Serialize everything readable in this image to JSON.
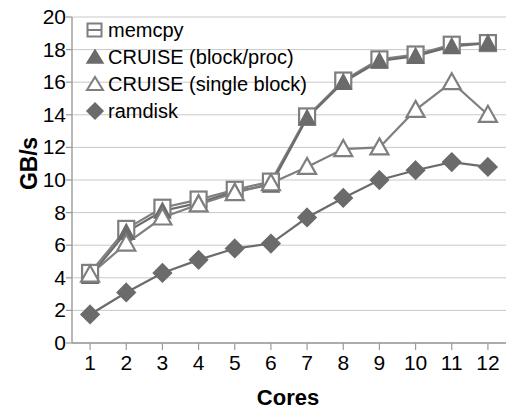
{
  "chart_data": {
    "type": "line",
    "title": "",
    "xlabel": "Cores",
    "ylabel": "GB/s",
    "x": [
      1,
      2,
      3,
      4,
      5,
      6,
      7,
      8,
      9,
      10,
      11,
      12
    ],
    "categories": [
      "1",
      "2",
      "3",
      "4",
      "5",
      "6",
      "7",
      "8",
      "9",
      "10",
      "11",
      "12"
    ],
    "xlim": [
      0.5,
      12.5
    ],
    "ylim": [
      0,
      20
    ],
    "ytick_labels": [
      "0",
      "2",
      "4",
      "6",
      "8",
      "10",
      "12",
      "14",
      "16",
      "18",
      "20"
    ],
    "ytick_values": [
      0,
      2,
      4,
      6,
      8,
      10,
      12,
      14,
      16,
      18,
      20
    ],
    "grid": true,
    "grid_axis": "y",
    "legend_position": "upper-left-inside",
    "series": [
      {
        "name": "memcpy",
        "marker": "open-square",
        "color": "#7f7f7f",
        "values": [
          4.3,
          7.0,
          8.3,
          8.8,
          9.4,
          9.9,
          13.9,
          16.1,
          17.4,
          17.7,
          18.3,
          18.4
        ]
      },
      {
        "name": "CRUISE (block/proc)",
        "marker": "filled-triangle",
        "color": "#6b6b6b",
        "values": [
          4.1,
          6.8,
          8.1,
          8.6,
          9.3,
          9.7,
          13.8,
          16.0,
          17.3,
          17.6,
          18.2,
          18.4
        ]
      },
      {
        "name": "CRUISE (single block)",
        "marker": "open-triangle",
        "color": "#7f7f7f",
        "values": [
          4.2,
          6.1,
          7.7,
          8.5,
          9.2,
          9.8,
          10.8,
          11.9,
          12.0,
          14.3,
          16.0,
          14.0
        ]
      },
      {
        "name": "ramdisk",
        "marker": "filled-diamond",
        "color": "#6b6b6b",
        "values": [
          1.75,
          3.1,
          4.3,
          5.1,
          5.8,
          6.1,
          7.7,
          8.9,
          10.0,
          10.6,
          11.1,
          10.8
        ]
      }
    ]
  },
  "legend": {
    "items": [
      {
        "label": "memcpy"
      },
      {
        "label": "CRUISE (block/proc)"
      },
      {
        "label": "CRUISE (single block)"
      },
      {
        "label": "ramdisk"
      }
    ]
  },
  "axis": {
    "x_title": "Cores",
    "y_title": "GB/s"
  },
  "colors": {
    "grid": "#c9c9c9",
    "axis": "#9a9a9a",
    "series_light": "#7f7f7f",
    "series_dark": "#6b6b6b",
    "text": "#000000",
    "background": "#ffffff"
  }
}
